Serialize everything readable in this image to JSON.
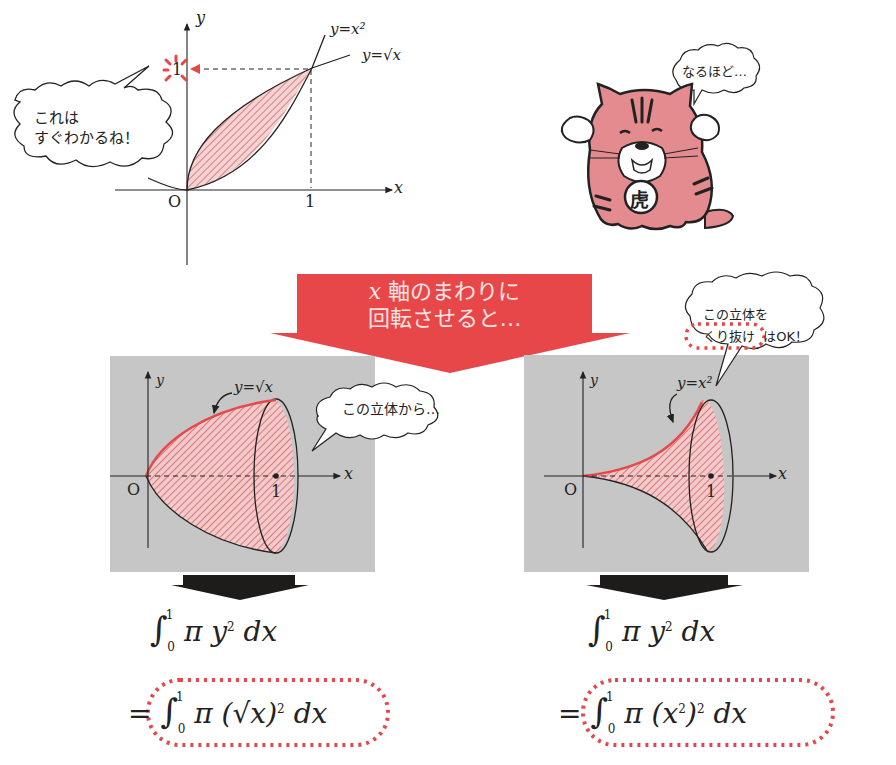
{
  "colors": {
    "accent_red": "#e8474a",
    "hatch_fill": "#f3c9c9",
    "hatch_stroke": "#c94b50",
    "panel_gray": "#c6c6c6",
    "tiger_pink": "#e48b8f",
    "dark_arrow": "#1e1b1b"
  },
  "top_graph": {
    "axis_x_label": "x",
    "axis_y_label": "y",
    "origin_label": "O",
    "x_tick_label": "1",
    "y_tick_label": "1",
    "curve1_label": "y=x²",
    "curve2_label": "y=√x"
  },
  "bubble_top_left": {
    "line1": "これは",
    "line2": "すぐわかるね！"
  },
  "mascot": {
    "badge_char": "虎",
    "speech": "なるほど…"
  },
  "center_arrow": {
    "line1_var": "x",
    "line1_text": "軸のまわりに",
    "line2": "回転させると…"
  },
  "left_panel": {
    "axis_x_label": "x",
    "axis_y_label": "y",
    "origin_label": "O",
    "x_tick_label": "1",
    "curve_label": "y=√x",
    "bubble": "この立体から…",
    "formula1": "∫₀¹ π y² dx",
    "formula2": "=∫₀¹ π (√x)² dx"
  },
  "right_panel": {
    "axis_x_label": "x",
    "axis_y_label": "y",
    "origin_label": "O",
    "x_tick_label": "1",
    "curve_label": "y=x²",
    "bubble_line1": "この立体を",
    "bubble_line2_highlight": "くり抜け",
    "bubble_line2_rest": "はOK！",
    "formula1": "∫₀¹ π y² dx",
    "formula2": "=∫₀¹ π (x²)² dx"
  },
  "formula_parts": {
    "int_sign": "∫",
    "upper": "1",
    "lower": "0",
    "pi": "π",
    "y": "y",
    "sq": "2",
    "dx": "dx",
    "eq": "=",
    "left_inner": "(√x)",
    "right_inner_open": "(x",
    "right_inner_close": ")"
  }
}
